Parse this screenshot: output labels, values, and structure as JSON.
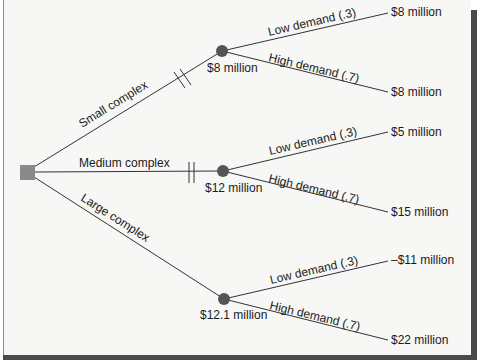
{
  "diagram": {
    "type": "decision-tree",
    "colors": {
      "decision_node": "#8a8a8a",
      "chance_node": "#555555",
      "line": "#333333",
      "background": "#f7f7f6"
    },
    "decision_node": {
      "shape": "square"
    },
    "branches": [
      {
        "label": "Small complex",
        "pruned": true,
        "expected_value": "$8 million",
        "outcomes": [
          {
            "label": "Low demand (.3)",
            "payoff": "$8 million"
          },
          {
            "label": "High demand (.7)",
            "payoff": "$8 million"
          }
        ]
      },
      {
        "label": "Medium complex",
        "pruned": true,
        "expected_value": "$12 million",
        "outcomes": [
          {
            "label": "Low demand (.3)",
            "payoff": "$5 million"
          },
          {
            "label": "High demand (.7)",
            "payoff": "$15 million"
          }
        ]
      },
      {
        "label": "Large complex",
        "pruned": false,
        "expected_value": "$12.1 million",
        "outcomes": [
          {
            "label": "Low demand (.3)",
            "payoff": "–$11 million"
          },
          {
            "label": "High demand (.7)",
            "payoff": "$22 million"
          }
        ]
      }
    ]
  }
}
